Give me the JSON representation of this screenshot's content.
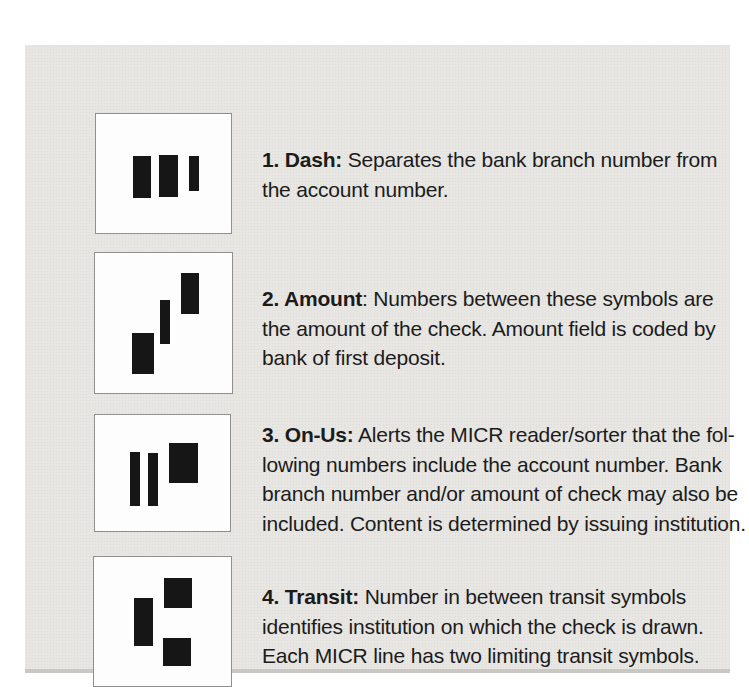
{
  "colors": {
    "paper": "#ffffff",
    "panel": "#e7e6e3",
    "panel-shadow": "#c9c8c3",
    "box-bg": "#fdfdfd",
    "box-border": "#8f8f8f",
    "bar": "#161616",
    "ink": "#1b1b1b"
  },
  "items": [
    {
      "symbol": "dash-micr-symbol",
      "lead": "1. Dash:",
      "lines": [
        " Separates the bank branch number from",
        "the account number."
      ],
      "bars": [
        {
          "x": 37,
          "y": 42,
          "w": 18,
          "h": 42
        },
        {
          "x": 63,
          "y": 41,
          "w": 19,
          "h": 42
        },
        {
          "x": 93,
          "y": 42,
          "w": 10,
          "h": 35
        }
      ]
    },
    {
      "symbol": "amount-micr-symbol",
      "lead": "2. Amount",
      "lines": [
        ": Numbers between these symbols are",
        "the amount of the check. Amount field is coded by",
        "bank of first deposit."
      ],
      "bars": [
        {
          "x": 37,
          "y": 80,
          "w": 22,
          "h": 41
        },
        {
          "x": 65,
          "y": 47,
          "w": 10,
          "h": 44
        },
        {
          "x": 86,
          "y": 20,
          "w": 18,
          "h": 41
        }
      ]
    },
    {
      "symbol": "on-us-micr-symbol",
      "lead": "3. On-Us:",
      "lines": [
        " Alerts the MICR reader/sorter that the fol-",
        "lowing numbers include the account number. Bank",
        "branch number and/or amount of check may also be",
        "included. Content is determined by issuing institution."
      ],
      "bars": [
        {
          "x": 35,
          "y": 37,
          "w": 10,
          "h": 54
        },
        {
          "x": 53,
          "y": 38,
          "w": 10,
          "h": 53
        },
        {
          "x": 74,
          "y": 28,
          "w": 29,
          "h": 40
        }
      ]
    },
    {
      "symbol": "transit-micr-symbol",
      "lead": "4. Transit:",
      "lines": [
        " Number in between transit symbols",
        "identifies institution on which the check is drawn.",
        "Each MICR line has two limiting transit symbols."
      ],
      "bars": [
        {
          "x": 40,
          "y": 41,
          "w": 19,
          "h": 48
        },
        {
          "x": 70,
          "y": 21,
          "w": 28,
          "h": 30
        },
        {
          "x": 69,
          "y": 81,
          "w": 28,
          "h": 28
        }
      ]
    }
  ]
}
